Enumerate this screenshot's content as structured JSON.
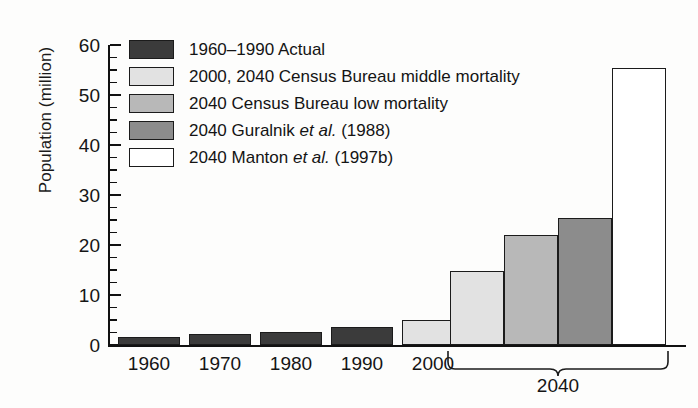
{
  "chart_data": {
    "type": "bar",
    "title": "",
    "xlabel": "",
    "ylabel": "Population (million)",
    "ylim": [
      0,
      60
    ],
    "ytick_step": 10,
    "yminor_step": 2.5,
    "grid": false,
    "yticks": [
      "0",
      "10",
      "20",
      "30",
      "40",
      "50",
      "60"
    ],
    "categories": [
      "1960",
      "1970",
      "1980",
      "1990",
      "2000",
      "2040",
      "2040",
      "2040",
      "2040"
    ],
    "xtick_labels": [
      "1960",
      "1970",
      "1980",
      "1990",
      "2000"
    ],
    "group_bracket_label": "2040",
    "legend_position": "upper-left",
    "bars": [
      {
        "label": "1960",
        "value": 1.6,
        "series": "1960-1990 Actual",
        "color": "#3b3b3b"
      },
      {
        "label": "1970",
        "value": 2.2,
        "series": "1960-1990 Actual",
        "color": "#3b3b3b"
      },
      {
        "label": "1980",
        "value": 2.7,
        "series": "1960-1990 Actual",
        "color": "#3b3b3b"
      },
      {
        "label": "1990",
        "value": 3.7,
        "series": "1960-1990 Actual",
        "color": "#3b3b3b"
      },
      {
        "label": "2000",
        "value": 5.0,
        "series": "2000, 2040 Census Bureau middle mortality",
        "color": "#e2e2e2"
      },
      {
        "label": "2040",
        "value": 14.8,
        "series": "2000, 2040 Census Bureau middle mortality",
        "color": "#e2e2e2"
      },
      {
        "label": "2040",
        "value": 22.0,
        "series": "2040 Census Bureau low mortality",
        "color": "#b8b8b8"
      },
      {
        "label": "2040",
        "value": 25.5,
        "series": "2040 Guralnik et al. (1988)",
        "color": "#8c8c8c"
      },
      {
        "label": "2040",
        "value": 55.5,
        "series": "2040 Manton et al. (1997b)",
        "color": "#ffffff"
      }
    ],
    "legend": [
      {
        "label_plain": "1960–1990 Actual",
        "label_pre": "1960–1990 Actual",
        "label_italic": "",
        "label_post": "",
        "color": "#3b3b3b"
      },
      {
        "label_plain": "2000, 2040 Census Bureau middle mortality",
        "label_pre": "2000, 2040 Census Bureau middle mortality",
        "label_italic": "",
        "label_post": "",
        "color": "#e2e2e2"
      },
      {
        "label_plain": "2040 Census Bureau low mortality",
        "label_pre": "2040 Census Bureau low mortality",
        "label_italic": "",
        "label_post": "",
        "color": "#b8b8b8"
      },
      {
        "label_plain": "2040 Guralnik et al. (1988)",
        "label_pre": "2040 Guralnik ",
        "label_italic": "et al.",
        "label_post": " (1988)",
        "color": "#8c8c8c"
      },
      {
        "label_plain": "2040 Manton et al. (1997b)",
        "label_pre": "2040 Manton ",
        "label_italic": "et al.",
        "label_post": " (1997b)",
        "color": "#ffffff"
      }
    ]
  }
}
